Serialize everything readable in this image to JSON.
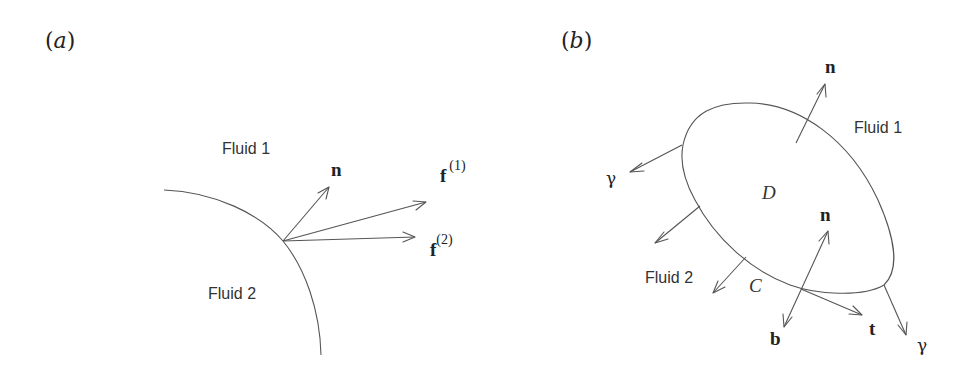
{
  "figure": {
    "panels": [
      {
        "id": "a",
        "tag": "a",
        "labels": {
          "fluid_top": "Fluid 1",
          "fluid_bottom": "Fluid 2",
          "normal": "n",
          "force1_base": "f",
          "force1_sup": "(1)",
          "force2_base": "f",
          "force2_sup": "(2)"
        },
        "interface": "circular arc separating Fluid 1 (outside) and Fluid 2 (inside)",
        "vectors": [
          "n",
          "f(1)",
          "f(2)"
        ]
      },
      {
        "id": "b",
        "tag": "b",
        "labels": {
          "fluid_outer": "Fluid 1",
          "fluid_lower": "Fluid 2",
          "region": "D",
          "boundary": "C",
          "normal_top": "n",
          "normal_edge": "n",
          "binormal": "b",
          "tangent": "t",
          "gamma_left": "γ",
          "gamma_right": "γ"
        },
        "interface": "tilted ellipse patch D bounded by contour C",
        "vectors": [
          "n",
          "n",
          "b",
          "t",
          "γ",
          "γ"
        ]
      }
    ],
    "colors": {
      "stroke": "#555555",
      "text": "#222222",
      "background": "#ffffff"
    }
  }
}
